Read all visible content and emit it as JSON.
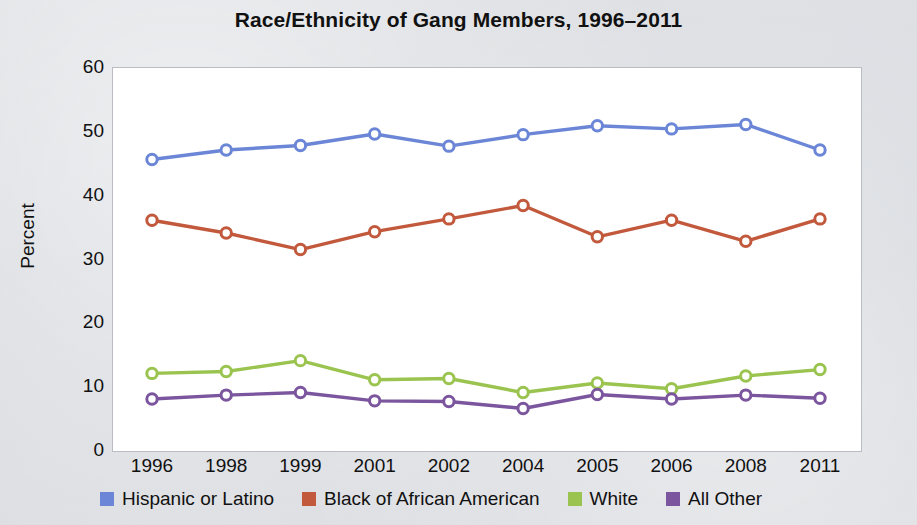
{
  "chart_data": {
    "type": "line",
    "title": "Race/Ethnicity of Gang Members, 1996–2011",
    "xlabel": "",
    "ylabel": "Percent",
    "categories": [
      "1996",
      "1998",
      "1999",
      "2001",
      "2002",
      "2004",
      "2005",
      "2006",
      "2008",
      "2011"
    ],
    "ylim": [
      0,
      60
    ],
    "yticks": [
      "0",
      "10",
      "20",
      "30",
      "40",
      "50",
      "60"
    ],
    "grid": false,
    "legend_position": "bottom",
    "series": [
      {
        "name": "Hispanic or Latino",
        "color": "#6b86d6",
        "values": [
          45.5,
          47.0,
          47.7,
          49.5,
          47.6,
          49.4,
          50.8,
          50.3,
          51.0,
          47.0
        ]
      },
      {
        "name": "Black of African American",
        "color": "#c2593c",
        "values": [
          36.0,
          34.0,
          31.4,
          34.2,
          36.2,
          38.3,
          33.4,
          36.0,
          32.7,
          36.2
        ]
      },
      {
        "name": "White",
        "color": "#9ac44f",
        "values": [
          12.0,
          12.3,
          14.0,
          11.0,
          11.2,
          9.0,
          10.5,
          9.6,
          11.6,
          12.6
        ]
      },
      {
        "name": "All Other",
        "color": "#7b569e",
        "values": [
          8.0,
          8.6,
          9.0,
          7.7,
          7.6,
          6.5,
          8.7,
          8.0,
          8.6,
          8.1
        ]
      }
    ]
  }
}
